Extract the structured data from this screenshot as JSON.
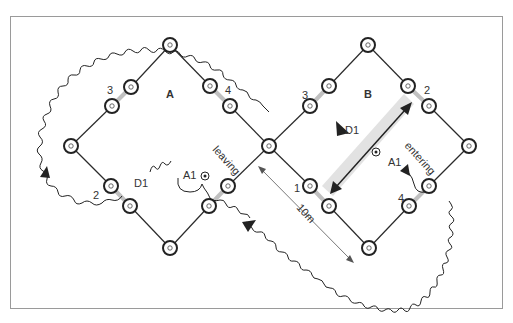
{
  "diagram": {
    "fields": [
      {
        "id": "A",
        "label": "A"
      },
      {
        "id": "B",
        "label": "B"
      }
    ],
    "node_labels_A": {
      "n3": "3",
      "n4": "4",
      "n2": "2"
    },
    "node_labels_B": {
      "n3": "3",
      "n2": "2",
      "n1": "1",
      "n4": "4"
    },
    "annotations": {
      "d1_left": "D1",
      "d1_right": "D1",
      "a1_left": "A1",
      "a1_right": "A1",
      "leaving": "leaving",
      "entering": "entering",
      "distance": "10m"
    },
    "colors": {
      "line": "#2a2a2a",
      "highlight": "#c8c8c8",
      "border": "#9a9a9a",
      "band": "#e2e2e2"
    }
  }
}
